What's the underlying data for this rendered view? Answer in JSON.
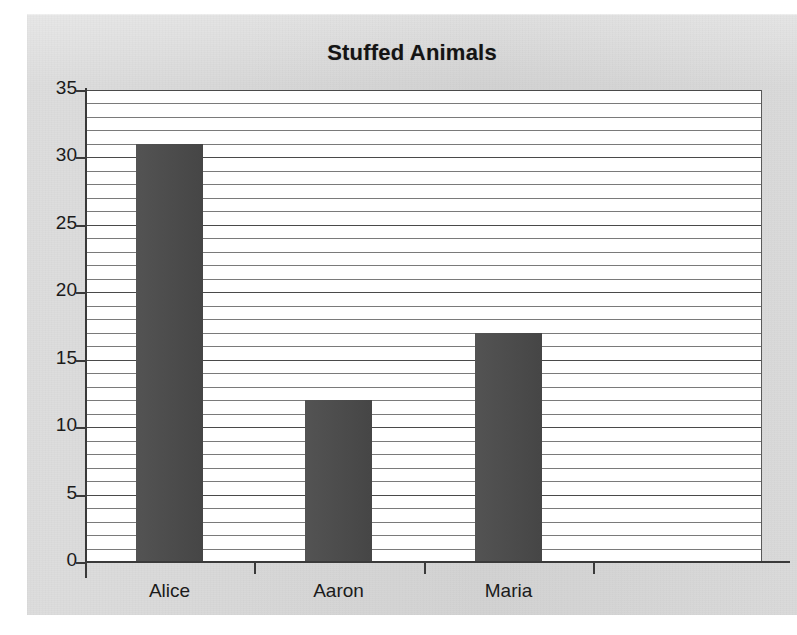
{
  "chart_data": {
    "type": "bar",
    "title": "Stuffed Animals",
    "xlabel": "",
    "ylabel": "",
    "categories": [
      "Alice",
      "Aaron",
      "Maria",
      ""
    ],
    "values": [
      31,
      12,
      17,
      null
    ],
    "series": [
      {
        "name": "Stuffed Animals",
        "values": [
          31,
          12,
          17,
          null
        ]
      }
    ],
    "ylim": [
      0,
      35
    ],
    "y_ticks": [
      0,
      5,
      10,
      15,
      20,
      25,
      30,
      35
    ],
    "y_tick_labels": [
      "0",
      "5",
      "10",
      "15",
      "20",
      "25",
      "30",
      "35"
    ],
    "minor_tick_step": 1,
    "grid": "horizontal",
    "legend": "none",
    "bar_color": "#4a4a4a",
    "plot_background": "#ffffff",
    "chart_background": "#d6d6d6"
  }
}
